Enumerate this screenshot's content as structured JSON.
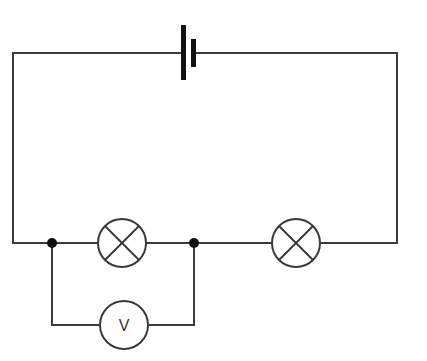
{
  "diagram": {
    "type": "circuit",
    "components": [
      {
        "id": "battery",
        "kind": "cell",
        "label": ""
      },
      {
        "id": "lamp1",
        "kind": "lamp",
        "label": ""
      },
      {
        "id": "lamp2",
        "kind": "lamp",
        "label": ""
      },
      {
        "id": "voltmeter",
        "kind": "voltmeter",
        "label": "V"
      }
    ],
    "junctions": 2
  },
  "voltmeter": {
    "symbol": "V"
  },
  "colors": {
    "wire": "#3a3a3a",
    "junction": "#111111",
    "background": "#ffffff"
  }
}
